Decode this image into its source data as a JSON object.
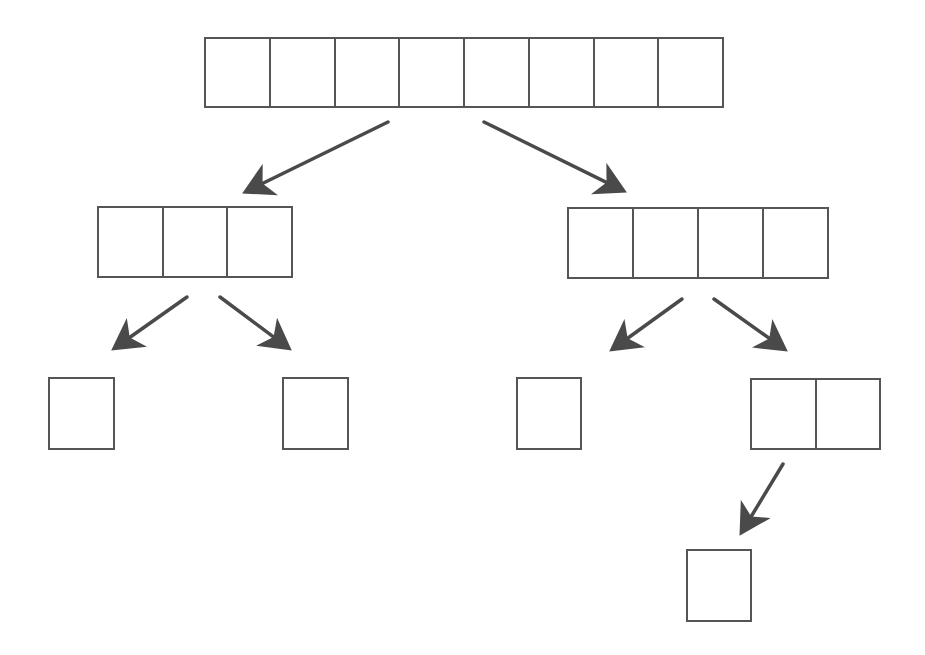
{
  "diagram": {
    "type": "array-split-tree",
    "line_color": "#555555",
    "arrow_color": "#4a4a4a",
    "background": "#ffffff",
    "nodes": [
      {
        "id": "root",
        "cells": 8,
        "x": 204,
        "y": 37,
        "w": 520,
        "h": 71,
        "level": 0
      },
      {
        "id": "l1-left",
        "cells": 3,
        "x": 97,
        "y": 206,
        "w": 196,
        "h": 72,
        "level": 1
      },
      {
        "id": "l1-right",
        "cells": 4,
        "x": 567,
        "y": 207,
        "w": 262,
        "h": 72,
        "level": 1
      },
      {
        "id": "l2-a",
        "cells": 1,
        "x": 48,
        "y": 377,
        "w": 67,
        "h": 73,
        "level": 2
      },
      {
        "id": "l2-b",
        "cells": 1,
        "x": 282,
        "y": 377,
        "w": 67,
        "h": 73,
        "level": 2
      },
      {
        "id": "l2-c",
        "cells": 1,
        "x": 516,
        "y": 377,
        "w": 66,
        "h": 73,
        "level": 2
      },
      {
        "id": "l2-d",
        "cells": 2,
        "x": 750,
        "y": 378,
        "w": 131,
        "h": 72,
        "level": 2
      },
      {
        "id": "l3-a",
        "cells": 1,
        "x": 686,
        "y": 549,
        "w": 66,
        "h": 73,
        "level": 3
      }
    ],
    "edges": [
      {
        "from": "root",
        "to": "l1-left",
        "x1": 388,
        "y1": 122,
        "x2": 243,
        "y2": 193
      },
      {
        "from": "root",
        "to": "l1-right",
        "x1": 484,
        "y1": 122,
        "x2": 626,
        "y2": 192
      },
      {
        "from": "l1-left",
        "to": "l2-a",
        "x1": 187,
        "y1": 297,
        "x2": 112,
        "y2": 350
      },
      {
        "from": "l1-left",
        "to": "l2-b",
        "x1": 220,
        "y1": 297,
        "x2": 291,
        "y2": 350
      },
      {
        "from": "l1-right",
        "to": "l2-c",
        "x1": 682,
        "y1": 299,
        "x2": 610,
        "y2": 351
      },
      {
        "from": "l1-right",
        "to": "l2-d",
        "x1": 714,
        "y1": 299,
        "x2": 787,
        "y2": 351
      },
      {
        "from": "l2-d",
        "to": "l3-a",
        "x1": 783,
        "y1": 464,
        "x2": 740,
        "y2": 535
      }
    ]
  }
}
